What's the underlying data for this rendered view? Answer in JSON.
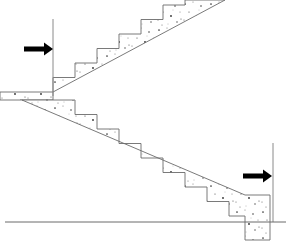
{
  "figure": {
    "background_color": "#ffffff",
    "outline_color": "#6b6b6b",
    "fill_pattern": "stipple-concrete",
    "arrow_color": "#000000",
    "reference_line_color": "#8a8a8a"
  },
  "canvas": {
    "width": 293,
    "height": 251
  },
  "annotations": {
    "left_arrow": {
      "name": "left-load-arrow",
      "direction": "right",
      "shaft_start_x": 24,
      "shaft_end_x": 46,
      "tip_x": 53,
      "y": 49,
      "color": "#000000"
    },
    "right_arrow": {
      "name": "right-load-arrow",
      "direction": "right",
      "shaft_start_x": 243,
      "shaft_end_x": 265,
      "tip_x": 272,
      "y": 176,
      "color": "#000000"
    }
  },
  "reference_lines": {
    "left_vertical": {
      "x": 53,
      "y_top": 19,
      "y_bottom": 96
    },
    "right_vertical": {
      "x": 273,
      "y_top": 143,
      "y_bottom": 222
    },
    "ground": {
      "x_start": 5,
      "x_end": 286,
      "y": 222
    }
  },
  "upper_flight": {
    "name": "upper-stair-flight",
    "direction": "ascending-right",
    "step_count": 8,
    "tread_width": 22,
    "riser_height": 14.5,
    "start_x": 53,
    "start_y": 92,
    "soffit_end_x": 225,
    "soffit_end_y": 0,
    "waist_thickness": 12
  },
  "lower_flight": {
    "name": "lower-stair-flight",
    "direction": "descending-right",
    "step_count": 8,
    "tread_width": 22,
    "riser_height": 14.5,
    "start_x": 53,
    "start_y": 100,
    "end_x": 245,
    "end_y": 215,
    "waist_thickness": 12
  },
  "landing": {
    "name": "mid-landing-slab",
    "x_start": 0,
    "x_end": 53,
    "top_y": 92,
    "bottom_y": 100,
    "thickness": 8
  },
  "base_block": {
    "name": "bottom-foundation-block",
    "x_start": 245,
    "x_end": 270,
    "top_y": 195,
    "bottom_y": 240
  }
}
